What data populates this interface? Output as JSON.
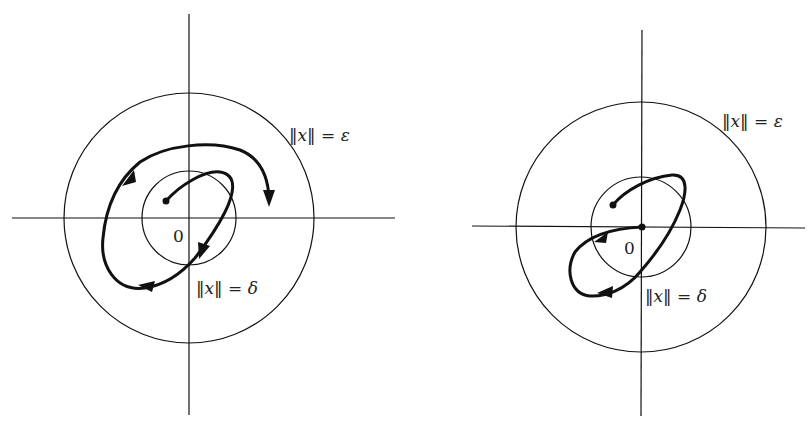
{
  "figures": [
    {
      "id": "stable",
      "origin_label": "0",
      "outer_circle_label": "‖x‖ = ε",
      "inner_circle_label": "‖x‖ = δ",
      "description": "Trajectory starting inside δ-ball stays within ε-ball"
    },
    {
      "id": "asymptotically-stable",
      "origin_label": "0",
      "outer_circle_label": "‖x‖ = ε",
      "inner_circle_label": "‖x‖ = δ",
      "description": "Trajectory starting inside δ-ball converges to origin"
    }
  ],
  "colors": {
    "line": "#111111",
    "text": "#222222",
    "background": "#ffffff"
  }
}
